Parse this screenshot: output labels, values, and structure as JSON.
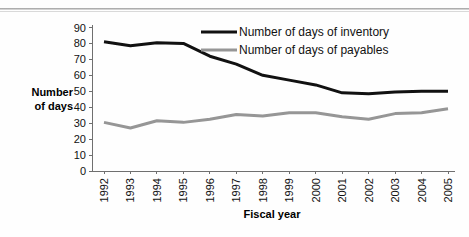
{
  "chart_data": {
    "type": "line",
    "title": "",
    "xlabel": "Fiscal year",
    "ylabel": "Number of days",
    "ylabel_lines": [
      "Number",
      "of days"
    ],
    "categories": [
      "1992",
      "1993",
      "1994",
      "1995",
      "1996",
      "1997",
      "1998",
      "1999",
      "2000",
      "2001",
      "2002",
      "2003",
      "2004",
      "2005"
    ],
    "ylim": [
      0,
      90
    ],
    "yticks": [
      0,
      10,
      20,
      30,
      40,
      50,
      60,
      70,
      80,
      90
    ],
    "grid": false,
    "legend_position": "top-center",
    "series": [
      {
        "name": "Number of days of inventory",
        "color": "#111111",
        "width": 3,
        "values": [
          81,
          78.5,
          80.5,
          80,
          72,
          67,
          60,
          57,
          54,
          49,
          48.5,
          49.5,
          50,
          50
        ]
      },
      {
        "name": "Number of days of payables",
        "color": "#969696",
        "width": 3,
        "values": [
          30.5,
          27,
          31.5,
          30.5,
          32.5,
          35.5,
          34.5,
          36.5,
          36.5,
          34,
          32.5,
          36,
          36.5,
          39
        ]
      }
    ]
  },
  "colors": {
    "inventory": "#111111",
    "payables": "#969696",
    "axis": "#6f6f6f",
    "background": "#fefefe"
  }
}
